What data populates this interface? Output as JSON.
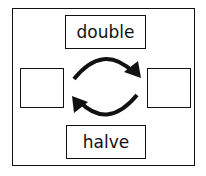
{
  "diagram": {
    "top_label": "double",
    "bottom_label": "halve",
    "left_box": "",
    "right_box": "",
    "arrows": [
      {
        "from": "left-box",
        "to": "right-box",
        "direction": "clockwise-top"
      },
      {
        "from": "right-box",
        "to": "left-box",
        "direction": "clockwise-bottom"
      }
    ],
    "stroke_color": "#111111"
  }
}
